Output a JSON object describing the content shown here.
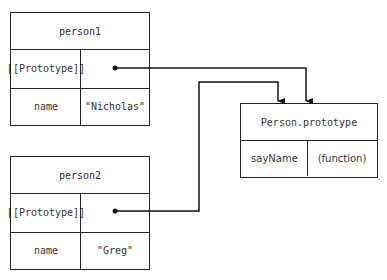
{
  "diagram": {
    "person1": {
      "title": "person1",
      "rows": [
        {
          "key": "[[Prototype]]",
          "value": ""
        },
        {
          "key": "name",
          "value": "\"Nicholas\""
        }
      ]
    },
    "person2": {
      "title": "person2",
      "rows": [
        {
          "key": "[[Prototype]]",
          "value": ""
        },
        {
          "key": "name",
          "value": "\"Greg\""
        }
      ]
    },
    "prototype": {
      "title": "Person.prototype",
      "rows": [
        {
          "key": "sayName",
          "value": "(function)"
        }
      ]
    },
    "edges": [
      {
        "from": "person1.[[Prototype]]",
        "to": "Person.prototype"
      },
      {
        "from": "person2.[[Prototype]]",
        "to": "Person.prototype"
      }
    ]
  }
}
